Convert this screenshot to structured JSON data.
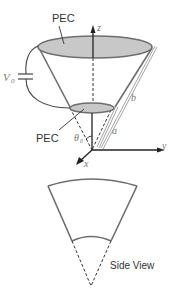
{
  "labels": {
    "pec_top": "PEC",
    "pec_bottom": "PEC",
    "voltage": "V",
    "voltage_sub": "0",
    "axis_z": "z",
    "axis_y": "y",
    "axis_x": "x",
    "radius_a": "a",
    "radius_b": "b",
    "angle": "θ",
    "angle_sub": "0",
    "side_view": "Side View"
  },
  "colors": {
    "cone_stroke": "#6e6e6e",
    "plate_fill": "#c8c8c8",
    "axis": "#222222",
    "dim_line": "#9a9a9a"
  }
}
